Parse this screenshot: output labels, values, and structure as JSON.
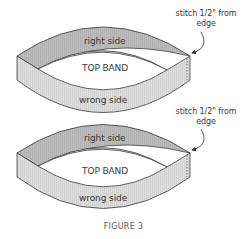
{
  "figure": {
    "caption": "FIGURE 3",
    "colors": {
      "right_side": "#b9b9b9",
      "wrong_side": "#dedede",
      "outline": "#3a3a3a",
      "text": "#3a3a3a"
    },
    "bands": [
      {
        "right_side_label": "right side",
        "center_label": "TOP BAND",
        "wrong_side_label": "wrong side",
        "annotation": {
          "line1": "stitch 1/2\" from",
          "line2": "edge"
        }
      },
      {
        "right_side_label": "right side",
        "center_label": "TOP BAND",
        "wrong_side_label": "wrong side",
        "annotation": {
          "line1": "stitch 1/2\" from",
          "line2": "edge"
        }
      }
    ]
  }
}
